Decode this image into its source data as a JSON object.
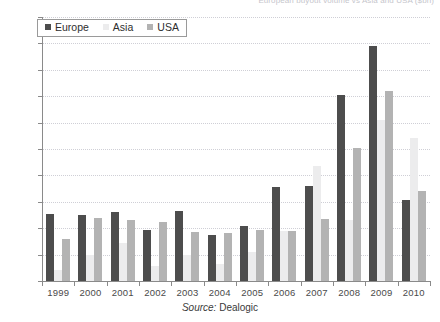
{
  "chart_data": {
    "type": "bar",
    "title": "European buyout volume vs Asia and USA ($bn)",
    "xlabel": "",
    "ylabel": "",
    "ylim": [
      0,
      200
    ],
    "ytick_step": 20,
    "grid": true,
    "legend_position": "top-left",
    "categories": [
      "1999",
      "2000",
      "2001",
      "2002",
      "2003",
      "2004",
      "2005",
      "2006",
      "2007",
      "2008",
      "2009",
      "2010"
    ],
    "series": [
      {
        "name": "Europe",
        "color": "#4d4d4d",
        "values": [
          51,
          50,
          52,
          39,
          53,
          35,
          42,
          71,
          72,
          141,
          178,
          61
        ]
      },
      {
        "name": "Asia",
        "color": "#ececed",
        "values": [
          8,
          20,
          29,
          11,
          20,
          13,
          22,
          38,
          87,
          46,
          122,
          108
        ]
      },
      {
        "name": "USA",
        "color": "#b3b3b3",
        "values": [
          32,
          48,
          46,
          45,
          37,
          36,
          39,
          38,
          47,
          101,
          144,
          68
        ]
      }
    ],
    "yticks": [
      0,
      20,
      40,
      60,
      80,
      100,
      120,
      140,
      160,
      180,
      200
    ]
  },
  "source": {
    "label": "Source:",
    "value": "Dealogic"
  }
}
